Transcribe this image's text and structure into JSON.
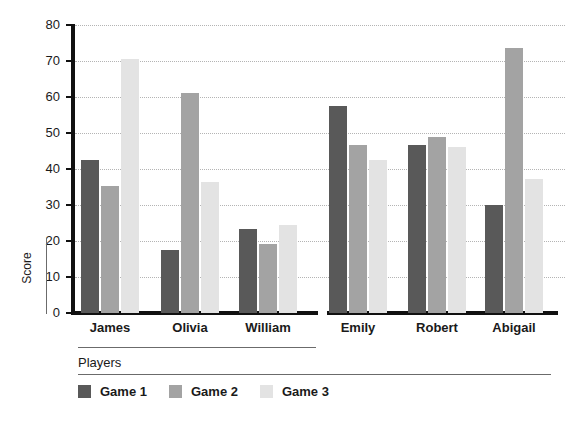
{
  "chart_data": {
    "type": "bar",
    "title": "",
    "xlabel": "Players",
    "ylabel": "Score",
    "ylim": [
      0,
      80
    ],
    "ytick_step": 10,
    "yticks": [
      80,
      70,
      60,
      50,
      40,
      30,
      20,
      10,
      0
    ],
    "grid": true,
    "grid_style": "dotted",
    "legend_position": "bottom-left",
    "categories": [
      "James",
      "Olivia",
      "William",
      "Emily",
      "Robert",
      "Abigail"
    ],
    "series": [
      {
        "name": "Game 1",
        "color": "#595959",
        "values": [
          42.5,
          17.4,
          23.3,
          57.5,
          46.6,
          30.0
        ]
      },
      {
        "name": "Game 2",
        "color": "#a3a3a3",
        "values": [
          35.4,
          61.2,
          19.2,
          46.6,
          49.0,
          73.6
        ]
      },
      {
        "name": "Game 3",
        "color": "#e3e3e3",
        "values": [
          70.5,
          36.5,
          24.4,
          42.6,
          46.1,
          37.2
        ]
      }
    ]
  },
  "axis": {
    "y_title": "Score",
    "x_title": "Players"
  },
  "legend": {
    "items": [
      {
        "label": "Game 1",
        "color": "#595959"
      },
      {
        "label": "Game 2",
        "color": "#a3a3a3"
      },
      {
        "label": "Game 3",
        "color": "#e3e3e3"
      }
    ]
  },
  "colors": {
    "background": "#ffffff",
    "axis": "#111111",
    "gridline": "#b4b4b4",
    "text": "#1a1a1a",
    "series_1": "#595959",
    "series_2": "#a3a3a3",
    "series_3": "#e3e3e3"
  }
}
